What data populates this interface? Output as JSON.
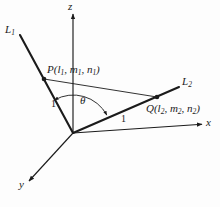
{
  "figure": {
    "kind": "3d-coordinate-axes-diagram",
    "background_color": "#fdfdfd",
    "stroke_color": "#1b1b1b",
    "axes": {
      "z": {
        "label": "z",
        "from": [
          73,
          133
        ],
        "to": [
          73,
          14
        ],
        "label_pos": [
          68,
          2
        ]
      },
      "x": {
        "label": "x",
        "from": [
          73,
          133
        ],
        "to": [
          203,
          124
        ],
        "label_pos": [
          206,
          118
        ]
      },
      "y": {
        "label": "y",
        "from": [
          73,
          133
        ],
        "to": [
          28,
          182
        ],
        "label_pos": [
          19,
          180
        ]
      }
    },
    "lines": [
      {
        "name": "L1",
        "label": "L",
        "label_sub": "1",
        "from": [
          20,
          35
        ],
        "to": [
          73,
          133
        ],
        "label_pos": [
          5,
          24
        ]
      },
      {
        "name": "L2",
        "label": "L",
        "label_sub": "2",
        "from": [
          73,
          133
        ],
        "to": [
          179,
          87
        ],
        "label_pos": [
          182,
          76
        ]
      }
    ],
    "points": [
      {
        "name": "P",
        "label": "P(l",
        "label_sub1": "1",
        "label_mid1": ", m",
        "label_sub2": "1",
        "label_mid2": ", n",
        "label_sub3": "1",
        "label_end": ")",
        "pos": [
          44,
          79
        ],
        "label_pos": [
          47,
          65
        ]
      },
      {
        "name": "Q",
        "label": "Q(l",
        "label_sub1": "2",
        "label_mid1": ", m",
        "label_sub2": "2",
        "label_mid2": ", n",
        "label_sub3": "2",
        "label_end": ")",
        "pos": [
          157,
          97
        ],
        "label_pos": [
          146,
          104
        ]
      }
    ],
    "chord": {
      "name": "PQ",
      "from": [
        44,
        79
      ],
      "to": [
        157,
        97
      ]
    },
    "lengths": [
      {
        "name": "OP-length",
        "value": "1",
        "pos": [
          51,
          99
        ]
      },
      {
        "name": "OQ-length",
        "value": "1",
        "pos": [
          121,
          115
        ]
      }
    ],
    "angle": {
      "symbol": "θ",
      "label_pos": [
        80,
        96
      ],
      "arc_center": [
        73,
        133
      ],
      "arc_radius": 38
    }
  }
}
